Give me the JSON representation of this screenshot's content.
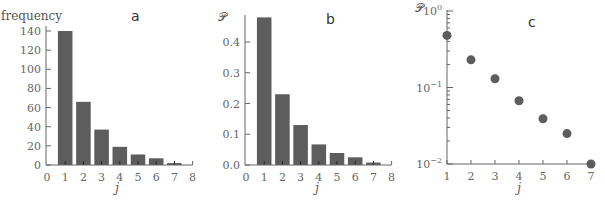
{
  "chart_data": [
    {
      "panel": "a",
      "type": "bar",
      "title": "",
      "xlabel": "j",
      "ylabel": "frequency",
      "categories": [
        1,
        2,
        3,
        4,
        5,
        6,
        7
      ],
      "values": [
        140,
        66,
        37,
        19,
        11,
        7,
        2
      ],
      "xlim": [
        0,
        8
      ],
      "ylim": [
        0,
        140
      ],
      "xticks": [
        "0",
        "1",
        "2",
        "3",
        "4",
        "5",
        "6",
        "7",
        "8"
      ],
      "yticks": [
        "0",
        "20",
        "40",
        "60",
        "80",
        "100",
        "120",
        "140"
      ],
      "grid": false,
      "color": "#5d5d5d"
    },
    {
      "panel": "b",
      "type": "bar",
      "title": "",
      "xlabel": "j",
      "ylabel": "𝒫",
      "categories": [
        1,
        2,
        3,
        4,
        5,
        6,
        7
      ],
      "values": [
        0.48,
        0.23,
        0.13,
        0.067,
        0.039,
        0.025,
        0.008
      ],
      "xlim": [
        0,
        8
      ],
      "ylim": [
        0,
        0.49
      ],
      "xticks": [
        "0",
        "1",
        "2",
        "3",
        "4",
        "5",
        "6",
        "7",
        "8"
      ],
      "yticks": [
        "0.0",
        "0.1",
        "0.2",
        "0.3",
        "0.4"
      ],
      "grid": false,
      "color": "#5d5d5d"
    },
    {
      "panel": "c",
      "type": "scatter",
      "title": "",
      "xlabel": "j",
      "ylabel": "𝒫",
      "x": [
        1,
        2,
        3,
        4,
        5,
        6,
        7
      ],
      "y": [
        0.48,
        0.23,
        0.13,
        0.067,
        0.039,
        0.025,
        0.01
      ],
      "yscale": "log",
      "xlim": [
        1,
        7
      ],
      "ylim": [
        0.01,
        1
      ],
      "xticks": [
        "1",
        "2",
        "3",
        "4",
        "5",
        "6",
        "7"
      ],
      "yticks": [
        "10^-2",
        "10^-1",
        "10^0"
      ],
      "grid": false,
      "color": "#5d5d5d"
    }
  ],
  "panels": {
    "a": {
      "letter": "a",
      "ylabel": "frequency",
      "xlabel": "j"
    },
    "b": {
      "letter": "b",
      "ylabel": "𝒫",
      "xlabel": "j"
    },
    "c": {
      "letter": "c",
      "ylabel": "𝒫",
      "xlabel": "j"
    }
  }
}
